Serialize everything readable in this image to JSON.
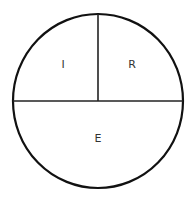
{
  "diagram": {
    "shape": "circle",
    "regions": [
      {
        "id": "top-left",
        "label": "I"
      },
      {
        "id": "top-right",
        "label": "R"
      },
      {
        "id": "bottom",
        "label": "E"
      }
    ],
    "colors": {
      "stroke": "#111111",
      "text": "#333333",
      "background": "#ffffff"
    }
  }
}
